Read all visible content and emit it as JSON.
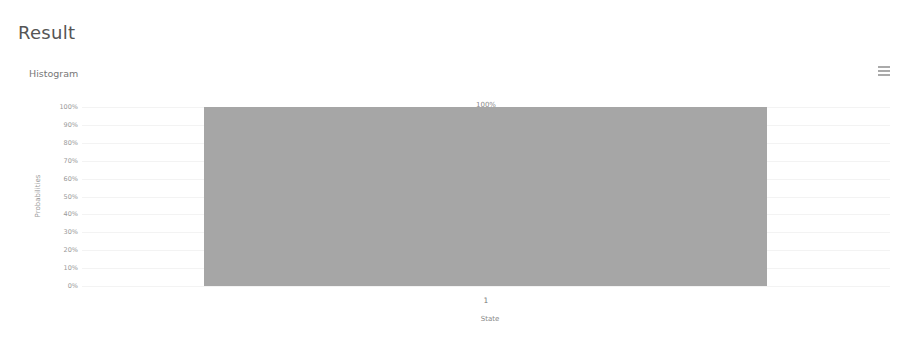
{
  "page": {
    "title": "Result",
    "panel_title": "Histogram",
    "menu_icon": "hamburger-menu-icon"
  },
  "chart_data": {
    "type": "bar",
    "title": "Histogram",
    "xlabel": "State",
    "ylabel": "Probabilities",
    "categories": [
      "1"
    ],
    "values": [
      1.0
    ],
    "value_labels": [
      "100%"
    ],
    "yticks": [
      "0%",
      "10%",
      "20%",
      "30%",
      "40%",
      "50%",
      "60%",
      "70%",
      "80%",
      "90%",
      "100%"
    ],
    "ylim": [
      0,
      1
    ],
    "grid": true,
    "legend": null,
    "bar_color": "#a6a6a6"
  }
}
